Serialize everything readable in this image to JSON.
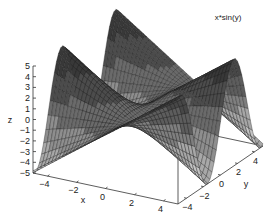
{
  "chart_data": {
    "type": "surface",
    "function": "x*sin(y)",
    "title": "",
    "legend": [
      {
        "label": "x*sin(y)",
        "position": "top-right"
      }
    ],
    "xlabel": "x",
    "ylabel": "y",
    "zlabel": "z",
    "xlim": [
      -5,
      5
    ],
    "ylim": [
      -5,
      5
    ],
    "zlim": [
      -5,
      5
    ],
    "x_ticks": [
      -4,
      -2,
      0,
      2,
      4
    ],
    "y_ticks": [
      -4,
      -2,
      0,
      2,
      4
    ],
    "z_ticks": [
      -5,
      -4,
      -3,
      -2,
      -1,
      0,
      1,
      2,
      3,
      4,
      5
    ],
    "grid_samples": 40,
    "colormap": "grayscale-banded",
    "band_colors": [
      "#a8a8a8",
      "#8e8e8e",
      "#6a6a6a",
      "#4c4c4c",
      "#383838"
    ],
    "grid": false
  },
  "labels": {
    "legend": "x*sin(y)",
    "x_axis": "x",
    "y_axis": "y",
    "z_axis": "z"
  }
}
